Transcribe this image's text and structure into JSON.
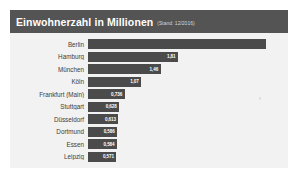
{
  "card": {
    "title": "Einwohnerzahl in Millionen",
    "subtitle": "(Stand: 12/2016)"
  },
  "colors": {
    "header_bg": "#545454",
    "card_bg": "#f2f2f2",
    "bar": "#4b4b4b",
    "title_text": "#ffffff",
    "label_text": "#3c3c3c",
    "value_text": "#ffffff",
    "page_bg": "#ffffff"
  },
  "chart_data": {
    "type": "bar",
    "orientation": "horizontal",
    "title": "Einwohnerzahl in Millionen",
    "subtitle": "(Stand: 12/2016)",
    "xlabel": "",
    "ylabel": "",
    "xlim": [
      0,
      3.8
    ],
    "grid": false,
    "legend": false,
    "categories": [
      "Berlin",
      "Hamburg",
      "München",
      "Köln",
      "Frankfurt (Main)",
      "Stuttgart",
      "Düsseldorf",
      "Dortmund",
      "Essen",
      "Leipzig"
    ],
    "values": [
      3.575,
      1.81,
      1.46,
      1.07,
      0.736,
      0.628,
      0.613,
      0.586,
      0.584,
      0.571
    ],
    "value_labels": [
      "3,575",
      "1,81",
      "1,46",
      "1,07",
      "0,736",
      "0,628",
      "0,613",
      "0,586",
      "0,584",
      "0,571"
    ],
    "bars": [
      {
        "category": "Berlin",
        "value": 3.575,
        "label": "3,575",
        "label_visible": false
      },
      {
        "category": "Hamburg",
        "value": 1.81,
        "label": "1,81",
        "label_visible": true
      },
      {
        "category": "München",
        "value": 1.46,
        "label": "1,46",
        "label_visible": true
      },
      {
        "category": "Köln",
        "value": 1.07,
        "label": "1,07",
        "label_visible": true
      },
      {
        "category": "Frankfurt (Main)",
        "value": 0.736,
        "label": "0,736",
        "label_visible": true
      },
      {
        "category": "Stuttgart",
        "value": 0.628,
        "label": "0,628",
        "label_visible": true
      },
      {
        "category": "Düsseldorf",
        "value": 0.613,
        "label": "0,613",
        "label_visible": true
      },
      {
        "category": "Dortmund",
        "value": 0.586,
        "label": "0,586",
        "label_visible": true
      },
      {
        "category": "Essen",
        "value": 0.584,
        "label": "0,584",
        "label_visible": true
      },
      {
        "category": "Leipzig",
        "value": 0.571,
        "label": "0,571",
        "label_visible": true
      }
    ]
  }
}
